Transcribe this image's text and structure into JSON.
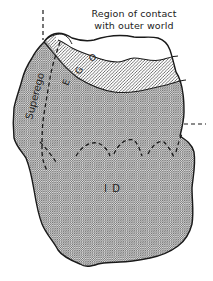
{
  "diagram": {
    "type": "structural-model-of-mind",
    "labels": {
      "region_line1": "Region of contact",
      "region_line2": "with outer world",
      "superego": "Superego",
      "ego_e": "E",
      "ego_g": "G",
      "ego_o": "O",
      "id": "I D"
    },
    "regions": [
      {
        "name": "Region of contact with outer world",
        "fill": "white"
      },
      {
        "name": "Ego",
        "fill": "diagonal-hatch"
      },
      {
        "name": "Superego",
        "fill": "crosshatch"
      },
      {
        "name": "Id",
        "fill": "crosshatch"
      }
    ],
    "colors": {
      "outline": "#1a1a1a",
      "hatch": "#333333",
      "background": "#ffffff"
    }
  }
}
